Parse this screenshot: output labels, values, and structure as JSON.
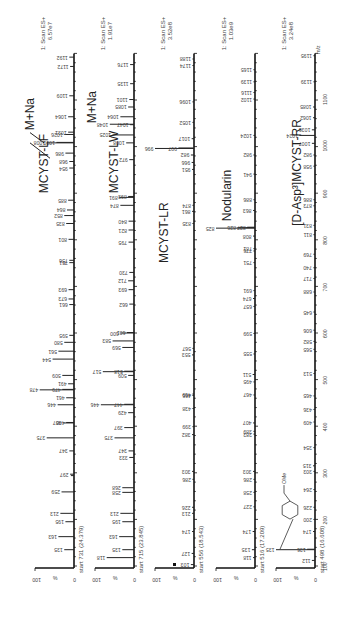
{
  "chart_data": {
    "type": "bar",
    "orientation": "rotated-90-ccw",
    "title": "",
    "xlabel": "m/z",
    "ylabel": "%",
    "xlim": [
      100,
      1200
    ],
    "ylim": [
      0,
      100
    ],
    "x_ticks": [
      100,
      200,
      300,
      400,
      500,
      600,
      700,
      800,
      900,
      1000,
      1100
    ],
    "y_ticks": [
      0,
      100
    ],
    "grid": false,
    "panels": [
      {
        "name": "MCYST-LF",
        "scan_label": "1: Scan ES+",
        "intensity": "6.57e7",
        "start_label": "start 731 (24.379)",
        "annotations": [
          "MCYST-LF",
          "M+Na"
        ],
        "peaks": [
          {
            "mz": 135,
            "pct": 25
          },
          {
            "mz": 163,
            "pct": 40
          },
          {
            "mz": 195,
            "pct": 22
          },
          {
            "mz": 213,
            "pct": 35
          },
          {
            "mz": 259,
            "pct": 32
          },
          {
            "mz": 294,
            "pct": 8
          },
          {
            "mz": 297,
            "pct": 10
          },
          {
            "mz": 347,
            "pct": 12
          },
          {
            "mz": 375,
            "pct": 70
          },
          {
            "mz": 407,
            "pct": 28
          },
          {
            "mz": 408,
            "pct": 20
          },
          {
            "mz": 446,
            "pct": 42
          },
          {
            "mz": 461,
            "pct": 20
          },
          {
            "mz": 478,
            "pct": 88
          },
          {
            "mz": 479,
            "pct": 30
          },
          {
            "mz": 491,
            "pct": 15
          },
          {
            "mz": 509,
            "pct": 30
          },
          {
            "mz": 544,
            "pct": 55
          },
          {
            "mz": 561,
            "pct": 40
          },
          {
            "mz": 580,
            "pct": 25
          },
          {
            "mz": 595,
            "pct": 12
          },
          {
            "mz": 661,
            "pct": 12
          },
          {
            "mz": 673,
            "pct": 14
          },
          {
            "mz": 693,
            "pct": 14
          },
          {
            "mz": 751,
            "pct": 12
          },
          {
            "mz": 756,
            "pct": 12
          },
          {
            "mz": 801,
            "pct": 14
          },
          {
            "mz": 835,
            "pct": 20
          },
          {
            "mz": 852,
            "pct": 25
          },
          {
            "mz": 864,
            "pct": 18
          },
          {
            "mz": 885,
            "pct": 15
          },
          {
            "mz": 954,
            "pct": 12
          },
          {
            "mz": 968,
            "pct": 12
          },
          {
            "mz": 986,
            "pct": 22
          },
          {
            "mz": 1008,
            "pct": 70
          },
          {
            "mz": 1009,
            "pct": 45
          },
          {
            "mz": 1026,
            "pct": 25
          },
          {
            "mz": 1031,
            "pct": 15
          },
          {
            "mz": 1064,
            "pct": 15
          },
          {
            "mz": 1109,
            "pct": 12
          },
          {
            "mz": 1172,
            "pct": 10
          },
          {
            "mz": 1192,
            "pct": 12
          }
        ]
      },
      {
        "name": "MCYST-LW",
        "scan_label": "1: Scan ES+",
        "intensity": "1.91e7",
        "start_label": "start 715 (23.845)",
        "annotations": [
          "MCYST-LW",
          "M+Na"
        ],
        "peaks": [
          {
            "mz": 118,
            "pct": 70
          },
          {
            "mz": 135,
            "pct": 30
          },
          {
            "mz": 163,
            "pct": 38
          },
          {
            "mz": 195,
            "pct": 30
          },
          {
            "mz": 213,
            "pct": 35
          },
          {
            "mz": 258,
            "pct": 30
          },
          {
            "mz": 268,
            "pct": 30
          },
          {
            "mz": 333,
            "pct": 12
          },
          {
            "mz": 347,
            "pct": 14
          },
          {
            "mz": 375,
            "pct": 50
          },
          {
            "mz": 397,
            "pct": 25
          },
          {
            "mz": 429,
            "pct": 15
          },
          {
            "mz": 446,
            "pct": 85
          },
          {
            "mz": 447,
            "pct": 25
          },
          {
            "mz": 509,
            "pct": 15
          },
          {
            "mz": 517,
            "pct": 80
          },
          {
            "mz": 518,
            "pct": 25
          },
          {
            "mz": 569,
            "pct": 30
          },
          {
            "mz": 583,
            "pct": 55
          },
          {
            "mz": 600,
            "pct": 35
          },
          {
            "mz": 601,
            "pct": 18
          },
          {
            "mz": 662,
            "pct": 12
          },
          {
            "mz": 693,
            "pct": 14
          },
          {
            "mz": 712,
            "pct": 15
          },
          {
            "mz": 730,
            "pct": 12
          },
          {
            "mz": 795,
            "pct": 14
          },
          {
            "mz": 821,
            "pct": 14
          },
          {
            "mz": 840,
            "pct": 14
          },
          {
            "mz": 874,
            "pct": 35
          },
          {
            "mz": 891,
            "pct": 38
          },
          {
            "mz": 893,
            "pct": 15
          },
          {
            "mz": 972,
            "pct": 12
          },
          {
            "mz": 1008,
            "pct": 20
          },
          {
            "mz": 1025,
            "pct": 55
          },
          {
            "mz": 1047,
            "pct": 10
          },
          {
            "mz": 1048,
            "pct": 62
          },
          {
            "mz": 1064,
            "pct": 35
          },
          {
            "mz": 1085,
            "pct": 15
          },
          {
            "mz": 1101,
            "pct": 12
          },
          {
            "mz": 1135,
            "pct": 10
          },
          {
            "mz": 1176,
            "pct": 10
          }
        ]
      },
      {
        "name": "MCYST-LR",
        "scan_label": "1: Scan ES+",
        "intensity": "3.52e8",
        "start_label": "start 556 (18.543)",
        "annotations": [
          "MCYST-LR"
        ],
        "peaks": [
          {
            "mz": 103,
            "pct": 8
          },
          {
            "mz": 127,
            "pct": 6
          },
          {
            "mz": 174,
            "pct": 5
          },
          {
            "mz": 213,
            "pct": 5
          },
          {
            "mz": 226,
            "pct": 5
          },
          {
            "mz": 286,
            "pct": 4
          },
          {
            "mz": 303,
            "pct": 5
          },
          {
            "mz": 382,
            "pct": 5
          },
          {
            "mz": 399,
            "pct": 4
          },
          {
            "mz": 438,
            "pct": 4
          },
          {
            "mz": 466,
            "pct": 4
          },
          {
            "mz": 469,
            "pct": 4
          },
          {
            "mz": 553,
            "pct": 5
          },
          {
            "mz": 567,
            "pct": 4
          },
          {
            "mz": 835,
            "pct": 4
          },
          {
            "mz": 861,
            "pct": 5
          },
          {
            "mz": 874,
            "pct": 4
          },
          {
            "mz": 951,
            "pct": 5
          },
          {
            "mz": 966,
            "pct": 6
          },
          {
            "mz": 982,
            "pct": 8
          },
          {
            "mz": 996,
            "pct": 100
          },
          {
            "mz": 997,
            "pct": 40
          },
          {
            "mz": 1017,
            "pct": 6
          },
          {
            "mz": 1052,
            "pct": 4
          },
          {
            "mz": 1096,
            "pct": 4
          },
          {
            "mz": 1174,
            "pct": 4
          },
          {
            "mz": 1188,
            "pct": 4
          }
        ]
      },
      {
        "name": "Nodularin",
        "scan_label": "1: Scan ES+",
        "intensity": "1.03e9",
        "start_label": "start 516 (17.209)",
        "annotations": [
          "Nodularin"
        ],
        "peaks": [
          {
            "mz": 118,
            "pct": 5
          },
          {
            "mz": 135,
            "pct": 8
          },
          {
            "mz": 174,
            "pct": 6
          },
          {
            "mz": 227,
            "pct": 4
          },
          {
            "mz": 258,
            "pct": 4
          },
          {
            "mz": 286,
            "pct": 4
          },
          {
            "mz": 303,
            "pct": 5
          },
          {
            "mz": 383,
            "pct": 4
          },
          {
            "mz": 389,
            "pct": 4
          },
          {
            "mz": 407,
            "pct": 5
          },
          {
            "mz": 467,
            "pct": 4
          },
          {
            "mz": 495,
            "pct": 4
          },
          {
            "mz": 511,
            "pct": 6
          },
          {
            "mz": 555,
            "pct": 4
          },
          {
            "mz": 599,
            "pct": 4
          },
          {
            "mz": 657,
            "pct": 4
          },
          {
            "mz": 674,
            "pct": 5
          },
          {
            "mz": 691,
            "pct": 4
          },
          {
            "mz": 751,
            "pct": 4
          },
          {
            "mz": 776,
            "pct": 4
          },
          {
            "mz": 781,
            "pct": 4
          },
          {
            "mz": 808,
            "pct": 5
          },
          {
            "mz": 825,
            "pct": 100
          },
          {
            "mz": 826,
            "pct": 45
          },
          {
            "mz": 827,
            "pct": 20
          },
          {
            "mz": 863,
            "pct": 5
          },
          {
            "mz": 886,
            "pct": 4
          },
          {
            "mz": 941,
            "pct": 4
          },
          {
            "mz": 982,
            "pct": 4
          },
          {
            "mz": 1024,
            "pct": 4
          },
          {
            "mz": 1102,
            "pct": 4
          },
          {
            "mz": 1116,
            "pct": 4
          },
          {
            "mz": 1139,
            "pct": 4
          },
          {
            "mz": 1165,
            "pct": 4
          }
        ]
      },
      {
        "name": "[D-Asp3]MCYST-RR",
        "scan_label": "1: Scan ES+",
        "intensity": "3.24e8",
        "start_label": "start 498 (16.608)",
        "annotations": [
          "[D-Asp³]MCYST-RR",
          "OMe"
        ],
        "peaks": [
          {
            "mz": 112,
            "pct": 8
          },
          {
            "mz": 135,
            "pct": 100
          },
          {
            "mz": 136,
            "pct": 20
          },
          {
            "mz": 174,
            "pct": 5
          },
          {
            "mz": 200,
            "pct": 4
          },
          {
            "mz": 226,
            "pct": 4
          },
          {
            "mz": 264,
            "pct": 4
          },
          {
            "mz": 303,
            "pct": 4
          },
          {
            "mz": 315,
            "pct": 5
          },
          {
            "mz": 354,
            "pct": 4
          },
          {
            "mz": 409,
            "pct": 4
          },
          {
            "mz": 436,
            "pct": 4
          },
          {
            "mz": 465,
            "pct": 4
          },
          {
            "mz": 513,
            "pct": 4
          },
          {
            "mz": 565,
            "pct": 4
          },
          {
            "mz": 582,
            "pct": 4
          },
          {
            "mz": 606,
            "pct": 4
          },
          {
            "mz": 645,
            "pct": 4
          },
          {
            "mz": 688,
            "pct": 4
          },
          {
            "mz": 717,
            "pct": 4
          },
          {
            "mz": 740,
            "pct": 4
          },
          {
            "mz": 769,
            "pct": 4
          },
          {
            "mz": 811,
            "pct": 4
          },
          {
            "mz": 831,
            "pct": 4
          },
          {
            "mz": 873,
            "pct": 4
          },
          {
            "mz": 886,
            "pct": 4
          },
          {
            "mz": 958,
            "pct": 4
          },
          {
            "mz": 982,
            "pct": 4
          },
          {
            "mz": 1007,
            "pct": 8
          },
          {
            "mz": 1024,
            "pct": 40
          },
          {
            "mz": 1036,
            "pct": 8
          },
          {
            "mz": 1062,
            "pct": 5
          },
          {
            "mz": 1085,
            "pct": 5
          },
          {
            "mz": 1139,
            "pct": 4
          },
          {
            "mz": 1195,
            "pct": 4
          }
        ]
      }
    ]
  },
  "labels": {
    "axis_unit": "m/z",
    "pct": "%",
    "y_top": "100",
    "y_bottom": "0"
  }
}
